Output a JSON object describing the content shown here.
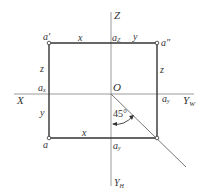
{
  "diagram": {
    "type": "three-view projection of point A",
    "axes": {
      "z_label": "Z",
      "x_label": "X",
      "yw_label": "Y",
      "yw_sub": "W",
      "yh_label": "Y",
      "yh_sub": "H",
      "origin_label": "O"
    },
    "points": {
      "a_prime": "a′",
      "a_double_prime": "a″",
      "a": "a",
      "a_z": "a",
      "a_z_sub": "Z",
      "a_x": "a",
      "a_x_sub": "x",
      "a_y_right": "a",
      "a_y_right_sub": "y",
      "a_y_bottom": "a",
      "a_y_bottom_sub": "y"
    },
    "dimensions": {
      "top_x": "x",
      "top_y": "y",
      "left_z": "z",
      "right_z": "z",
      "left_y": "y",
      "bottom_x": "x"
    },
    "angle_label": "45°",
    "colors": {
      "axis": "#9a9a9a",
      "frame": "#333333",
      "text": "#333333"
    }
  }
}
